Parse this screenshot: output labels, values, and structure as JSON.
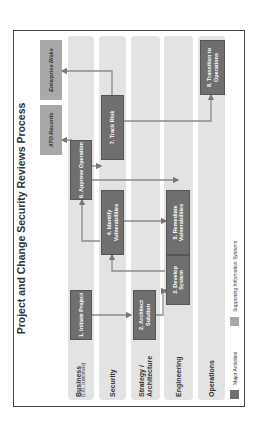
{
  "title": "Project and Change Security Reviews Process",
  "lanes": [
    {
      "label": "Business",
      "sublabel": "(CIO, customers)"
    },
    {
      "label": "Security",
      "sublabel": ""
    },
    {
      "label": "Strategy / Architecture",
      "sublabel": ""
    },
    {
      "label": "Engineering",
      "sublabel": ""
    },
    {
      "label": "Operations",
      "sublabel": ""
    }
  ],
  "activities": [
    {
      "id": 1,
      "label": "1. Initiate Project",
      "lane": "Business"
    },
    {
      "id": 2,
      "label": "2. Architect Solution",
      "lane": "Strategy / Architecture"
    },
    {
      "id": 3,
      "label": "3. Develop System",
      "lane": "Engineering"
    },
    {
      "id": 4,
      "label": "4. Identify Vulnerabilities",
      "lane": "Security"
    },
    {
      "id": 5,
      "label": "5. Remediate Vulnerabilities",
      "lane": "Engineering"
    },
    {
      "id": 6,
      "label": "6. Approve Operation",
      "lane": "Business"
    },
    {
      "id": 7,
      "label": "7. Track Risk",
      "lane": "Security"
    },
    {
      "id": 8,
      "label": "8. Transition to Operations",
      "lane": "Operations"
    }
  ],
  "systems": [
    {
      "label": "ATO Records"
    },
    {
      "label": "Enterprise Risks"
    }
  ],
  "flows": [
    [
      "1. Initiate Project",
      "2. Architect Solution"
    ],
    [
      "2. Architect Solution",
      "3. Develop System"
    ],
    [
      "3. Develop System",
      "4. Identify Vulnerabilities"
    ],
    [
      "4. Identify Vulnerabilities",
      "5. Remediate Vulnerabilities"
    ],
    [
      "4. Identify Vulnerabilities",
      "6. Approve Operation"
    ],
    [
      "5. Remediate Vulnerabilities",
      "3. Develop System"
    ],
    [
      "6. Approve Operation",
      "7. Track Risk"
    ],
    [
      "6. Approve Operation",
      "5. Remediate Vulnerabilities"
    ],
    [
      "6. Approve Operation",
      "ATO Records"
    ],
    [
      "7. Track Risk",
      "Enterprise Risks"
    ],
    [
      "7. Track Risk",
      "8. Transition to Operations"
    ]
  ],
  "legend": {
    "major": "Major Activities",
    "supporting": "Supporting Information Systems"
  },
  "colors": {
    "activity": "#6f6f6f",
    "system": "#a9a9a9",
    "lane": "#e3e3e3"
  }
}
